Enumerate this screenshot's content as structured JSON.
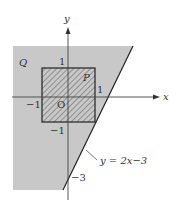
{
  "diagram": {
    "type": "coordinate-region-plot",
    "colors": {
      "region_q_fill": "#c8c8c8",
      "square_p_hatch": "#555555",
      "axis": "#333333",
      "line": "#222222",
      "background": "#ffffff"
    },
    "axes": {
      "x_label": "x",
      "y_label": "y",
      "origin_label": "O"
    },
    "ticks": {
      "x_pos": "1",
      "x_neg": "−1",
      "y_pos": "1",
      "y_neg": "−1",
      "y_intercept": "−3"
    },
    "regions": {
      "q_label": "Q",
      "p_label": "P"
    },
    "line": {
      "equation": "y = 2x−3"
    }
  }
}
